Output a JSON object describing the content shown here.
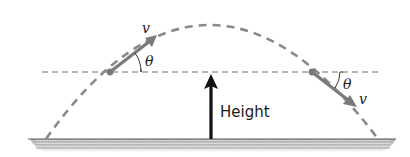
{
  "diagram": {
    "labels": {
      "velocity_left": "v",
      "angle_left": "θ",
      "velocity_right": "v",
      "angle_right": "θ",
      "height": "Height"
    },
    "colors": {
      "trajectory": "#8a8a8a",
      "reference_line": "#6e6e6e",
      "velocity_arrow": "#7a7a7a",
      "height_arrow": "#111111",
      "ground_line": "#555555",
      "ground_shade": "#b5b5b5",
      "text": "#1a1a1a"
    },
    "geometry": {
      "ground_y": 139,
      "launch_x": 46,
      "landing_x": 378,
      "apex": [
        205,
        25
      ],
      "reference_height_y": 72,
      "left_point": [
        110,
        72
      ],
      "right_point": [
        312,
        72
      ],
      "height_arrow_x": 211
    }
  }
}
